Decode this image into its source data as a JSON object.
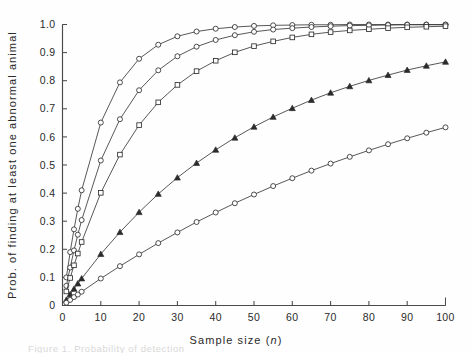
{
  "figure": {
    "caption_partial": "Figure 1.  Probability of detection",
    "background": "#ffffff"
  },
  "chart_data": {
    "type": "line",
    "title": "",
    "xlabel": "Sample size (n)",
    "ylabel": "Prob. of finding at least one abnormal animal",
    "xlim": [
      0,
      100
    ],
    "ylim": [
      0,
      1.0
    ],
    "grid": false,
    "legend": "none",
    "xticks": [
      0,
      10,
      20,
      30,
      40,
      50,
      60,
      70,
      80,
      90,
      100
    ],
    "xtick_labels": [
      "0",
      "10",
      "20",
      "30",
      "40",
      "50",
      "60",
      "70",
      "80",
      "90",
      "100"
    ],
    "yticks": [
      0,
      0.1,
      0.2,
      0.3,
      0.4,
      0.5,
      0.6,
      0.7,
      0.8,
      0.9,
      1.0
    ],
    "ytick_labels": [
      "0",
      "0.1",
      "0.2",
      "0.3",
      "0.4",
      "0.5",
      "0.6",
      "0.7",
      "0.8",
      "0.9",
      "1.0"
    ],
    "x": [
      1,
      2,
      3,
      4,
      5,
      10,
      15,
      20,
      25,
      30,
      35,
      40,
      45,
      50,
      55,
      60,
      65,
      70,
      75,
      80,
      85,
      90,
      95,
      100
    ],
    "series": [
      {
        "name": "prevalence 0.10",
        "marker": "open-circle",
        "values": [
          0.1,
          0.19,
          0.271,
          0.344,
          0.41,
          0.651,
          0.794,
          0.878,
          0.928,
          0.958,
          0.975,
          0.985,
          0.991,
          0.995,
          0.997,
          0.998,
          0.999,
          0.999,
          1.0,
          1.0,
          1.0,
          1.0,
          1.0,
          1.0
        ]
      },
      {
        "name": "prevalence 0.07",
        "marker": "open-circle",
        "values": [
          0.07,
          0.135,
          0.196,
          0.252,
          0.304,
          0.516,
          0.663,
          0.766,
          0.837,
          0.887,
          0.921,
          0.945,
          0.962,
          0.974,
          0.982,
          0.987,
          0.991,
          0.994,
          0.996,
          0.997,
          0.998,
          0.999,
          0.999,
          0.999
        ]
      },
      {
        "name": "prevalence 0.05",
        "marker": "open-square",
        "values": [
          0.05,
          0.098,
          0.143,
          0.185,
          0.226,
          0.401,
          0.537,
          0.642,
          0.723,
          0.785,
          0.834,
          0.871,
          0.901,
          0.923,
          0.94,
          0.954,
          0.965,
          0.973,
          0.979,
          0.983,
          0.987,
          0.99,
          0.992,
          0.994
        ]
      },
      {
        "name": "prevalence 0.02",
        "marker": "filled-triangle",
        "values": [
          0.02,
          0.04,
          0.059,
          0.078,
          0.096,
          0.183,
          0.261,
          0.332,
          0.397,
          0.455,
          0.507,
          0.554,
          0.597,
          0.636,
          0.671,
          0.702,
          0.731,
          0.757,
          0.78,
          0.801,
          0.82,
          0.838,
          0.853,
          0.867
        ]
      },
      {
        "name": "prevalence 0.01",
        "marker": "open-circle",
        "values": [
          0.01,
          0.02,
          0.03,
          0.039,
          0.049,
          0.096,
          0.14,
          0.182,
          0.222,
          0.26,
          0.297,
          0.331,
          0.364,
          0.395,
          0.425,
          0.453,
          0.48,
          0.505,
          0.529,
          0.552,
          0.574,
          0.595,
          0.615,
          0.634
        ]
      }
    ]
  }
}
